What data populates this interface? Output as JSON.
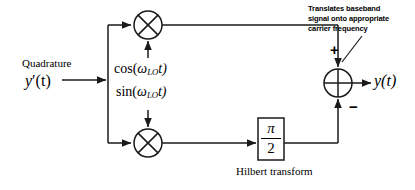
{
  "figure": {
    "type": "block-diagram",
    "background": "#ffffff",
    "line_color": "#1a1a1a"
  },
  "labels": {
    "quadrature": "Quadrature",
    "input_signal_base": "y",
    "input_signal_prime": "′(t)",
    "cos_prefix": "cos(",
    "cos_omega": "ω",
    "cos_sub": "LO",
    "cos_suffix": "t)",
    "sin_prefix": "sin(",
    "sin_omega": "ω",
    "sin_sub": "LO",
    "sin_suffix": "t)",
    "annotation_line1": "Translates baseband",
    "annotation_line2": "signal onto appropriate",
    "annotation_line3": "carrier frequency",
    "sum_plus": "+",
    "sum_minus": "−",
    "output_signal_base": "y",
    "output_signal_arg": "(t)",
    "hilbert_caption": "Hilbert transform",
    "hilbert_numerator": "π",
    "hilbert_denominator": "2"
  },
  "blocks": [
    {
      "name": "mixer-top",
      "symbol": "multiplier",
      "glyph": "⊗",
      "center_x": 148,
      "center_y": 25,
      "radius": 14,
      "carrier_input": "cos(ωLOt)"
    },
    {
      "name": "mixer-bottom",
      "symbol": "multiplier",
      "glyph": "⊗",
      "center_x": 148,
      "center_y": 143,
      "radius": 14,
      "carrier_input": "sin(ωLOt)"
    },
    {
      "name": "summing-junction",
      "symbol": "adder",
      "glyph": "⊕",
      "center_x": 338,
      "center_y": 83,
      "radius": 14,
      "signs": [
        "+",
        "−"
      ]
    },
    {
      "name": "hilbert-transform-block",
      "symbol": "phase-shift",
      "content": "π/2",
      "x": 258,
      "y": 118,
      "width": 26,
      "height": 42,
      "caption": "Hilbert transform"
    }
  ],
  "signals": {
    "input": "y′(t)",
    "output": "y(t)",
    "branch_x": 108,
    "top_path_y": 25,
    "bottom_path_y": 143
  }
}
